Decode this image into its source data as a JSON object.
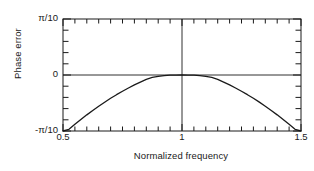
{
  "chart_data": {
    "type": "line",
    "title": "",
    "subtitle": "",
    "xlabel": "Normalized frequency",
    "ylabel": "Phase error",
    "xlim": [
      0.5,
      1.5
    ],
    "ylim": [
      -0.3141592653589793,
      0.3141592653589793
    ],
    "ylim_labels": [
      "-π/10",
      "π/10"
    ],
    "grid": false,
    "legend": false,
    "legend_position": "none",
    "axis_box": true,
    "ticks_direction": "in",
    "x_tick_labels": [
      "0.5",
      "1",
      "1.5"
    ],
    "x_tick_label_values": [
      0.5,
      1.0,
      1.5
    ],
    "x_minor_tick_step": 0.05,
    "x_minor_tick_count": 21,
    "y_tick_labels": [
      "-π/10",
      "0",
      "π/10"
    ],
    "y_tick_label_values": [
      -0.3141592653589793,
      0,
      0.3141592653589793
    ],
    "y_minor_tick_step": 0.06283185307179587,
    "y_minor_tick_count": 11,
    "reference_lines": [
      {
        "orientation": "vertical",
        "value": 1.0
      },
      {
        "orientation": "horizontal",
        "value": 0.0
      }
    ],
    "series": [
      {
        "name": "Phase error",
        "color": "#1a1a1a",
        "linewidth": 1.3,
        "x": [
          0.5,
          0.525,
          0.55,
          0.575,
          0.6,
          0.625,
          0.65,
          0.675,
          0.7,
          0.725,
          0.75,
          0.775,
          0.8,
          0.825,
          0.85,
          0.875,
          0.9,
          0.925,
          0.95,
          0.975,
          1.0,
          1.025,
          1.05,
          1.075,
          1.1,
          1.125,
          1.15,
          1.175,
          1.2,
          1.225,
          1.25,
          1.275,
          1.3,
          1.325,
          1.35,
          1.375,
          1.4,
          1.425,
          1.45,
          1.475,
          1.5
        ],
        "y": [
          -0.334,
          -0.3048,
          -0.2766,
          -0.2496,
          -0.2236,
          -0.1988,
          -0.175,
          -0.1524,
          -0.1308,
          -0.1104,
          -0.091,
          -0.0728,
          -0.0556,
          -0.0396,
          -0.0246,
          -0.0138,
          -0.0078,
          -0.0036,
          -0.0012,
          -0.0002,
          0.0,
          -0.0002,
          -0.0012,
          -0.0036,
          -0.0078,
          -0.0138,
          -0.0246,
          -0.0396,
          -0.0556,
          -0.0728,
          -0.091,
          -0.1104,
          -0.1308,
          -0.1524,
          -0.175,
          -0.1988,
          -0.2236,
          -0.2496,
          -0.2766,
          -0.3048,
          -0.334
        ]
      }
    ],
    "annotations": [],
    "peak": {
      "x": 1.0,
      "y": 0.0
    },
    "endpoints": [
      {
        "x": 0.51,
        "y": -0.3141592653589793
      },
      {
        "x": 1.49,
        "y": -0.3141592653589793
      }
    ]
  },
  "style": {
    "background": "#ffffff",
    "axis_color": "#1a1a1a",
    "curve_color": "#1a1a1a",
    "text_color": "#1a1a1a"
  }
}
